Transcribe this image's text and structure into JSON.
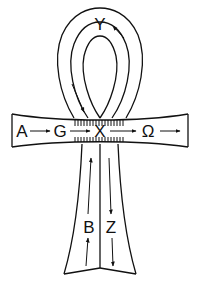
{
  "diagram": {
    "type": "ankh-flow-diagram",
    "stroke_color": "#111111",
    "background": "#ffffff",
    "labels": {
      "a": "A",
      "g": "G",
      "x": "X",
      "omega": "Ω",
      "y": "Y",
      "b": "B",
      "z": "Z"
    },
    "flows": [
      {
        "from": "A",
        "to": "G",
        "region": "crossbar-left"
      },
      {
        "from": "G",
        "to": "X",
        "region": "crossbar-left"
      },
      {
        "from": "X",
        "to": "Ω",
        "region": "crossbar-right"
      },
      {
        "from": "Ω",
        "to": "exit-right",
        "region": "crossbar-right"
      },
      {
        "from": "X",
        "to": "Y",
        "region": "loop-right-up"
      },
      {
        "from": "Y",
        "to": "X",
        "region": "loop-left-down"
      },
      {
        "from": "B",
        "to": "X",
        "region": "stem-left-up"
      },
      {
        "from": "X",
        "to": "Z",
        "region": "stem-right-down"
      }
    ]
  }
}
